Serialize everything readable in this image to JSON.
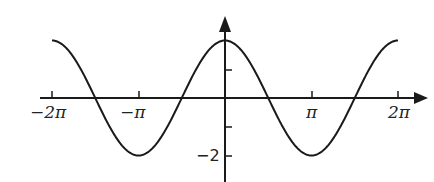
{
  "chart_data": {
    "type": "line",
    "title": "",
    "function": "y = 2 cos(x)",
    "xlabel": "",
    "ylabel": "",
    "xlim": [
      -6.2832,
      6.2832
    ],
    "ylim": [
      -2,
      2
    ],
    "x_tick_labels": [
      "-2π",
      "-π",
      "π",
      "2π"
    ],
    "x_tick_values": [
      -6.2832,
      -3.1416,
      3.1416,
      6.2832
    ],
    "y_tick_labels": [
      "-2"
    ],
    "y_tick_values": [
      2,
      1,
      -1,
      -2
    ],
    "grid": false,
    "legend": null,
    "series": [
      {
        "name": "2cos(x)",
        "x": [
          -6.2832,
          -4.7124,
          -3.1416,
          -1.5708,
          0,
          1.5708,
          3.1416,
          4.7124,
          6.2832
        ],
        "values": [
          2,
          0,
          -2,
          0,
          2,
          0,
          -2,
          0,
          2
        ]
      }
    ],
    "colors": {
      "curve": "#1a1a1a",
      "axes": "#1a1a1a"
    }
  },
  "labels": {
    "x_neg_2pi": "−2π",
    "x_neg_pi": "−π",
    "x_pi": "π",
    "x_2pi": "2π",
    "y_neg_2": "−2"
  }
}
